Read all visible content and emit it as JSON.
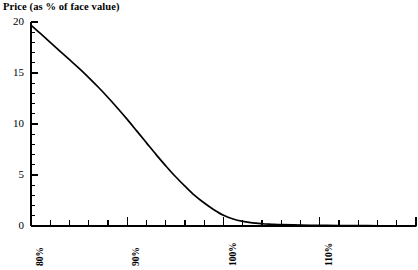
{
  "chart_data": {
    "type": "line",
    "title": "Price (as % of face value)",
    "xlabel": "",
    "ylabel": "Price (as % of face value)",
    "xlim": [
      80,
      120
    ],
    "ylim": [
      0,
      20
    ],
    "grid": false,
    "legend": null,
    "x_unit": "%",
    "y_tick_labels": [
      "0",
      "5",
      "10",
      "15",
      "20"
    ],
    "y_ticks": [
      0,
      5,
      10,
      15,
      20
    ],
    "y_minor_tick_step": 1,
    "x_tick_labels": [
      "80%",
      "90%",
      "100%",
      "110%",
      "120%"
    ],
    "x_ticks": [
      80,
      90,
      100,
      110,
      120
    ],
    "x_minor_tick_step": 2,
    "series": [
      {
        "name": "Price",
        "x": [
          80,
          81,
          82,
          83,
          84,
          85,
          86,
          87,
          88,
          89,
          90,
          91,
          92,
          93,
          94,
          95,
          96,
          97,
          98,
          99,
          100,
          101,
          102,
          103,
          104,
          105,
          106,
          108,
          110,
          112,
          115,
          118,
          120
        ],
        "values": [
          19.7,
          18.85,
          18.0,
          17.15,
          16.3,
          15.45,
          14.55,
          13.6,
          12.6,
          11.55,
          10.45,
          9.3,
          8.15,
          7.0,
          5.9,
          4.85,
          3.9,
          3.0,
          2.25,
          1.6,
          1.05,
          0.68,
          0.45,
          0.3,
          0.22,
          0.17,
          0.13,
          0.09,
          0.06,
          0.05,
          0.03,
          0.02,
          0.02
        ]
      }
    ]
  },
  "colors": {
    "background": "#ffffff",
    "ink": "#000000",
    "curve": "#000000"
  }
}
